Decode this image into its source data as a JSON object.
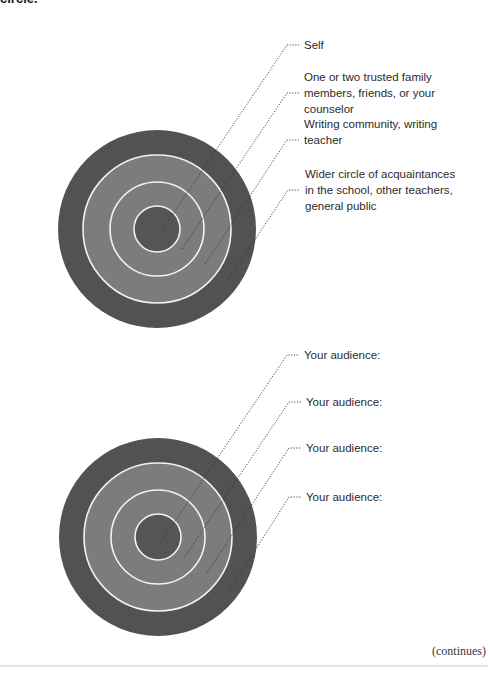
{
  "heading": "circle.",
  "colors": {
    "outer_ring": "#525252",
    "middle_band": "#7c7c7c",
    "inner_core": "#555555",
    "ring_line": "#f2f2f2",
    "leader_line": "#333333"
  },
  "diagrams": [
    {
      "id": "example",
      "center": [
        157,
        229
      ],
      "radii": {
        "outer": 99,
        "ring3": 74,
        "ring2": 47,
        "inner": 23
      },
      "labels": [
        {
          "text": "Self",
          "line_y": 45,
          "elbow_x": 287,
          "end": [
            160,
            233
          ],
          "text_top": 37
        },
        {
          "text": "One or two trusted family\nmembers, friends, or your\ncounselor",
          "line_y": 93,
          "elbow_x": 287,
          "end": [
            182,
            249
          ],
          "text_top": 69
        },
        {
          "text": "Writing community, writing\nteacher",
          "line_y": 140,
          "elbow_x": 287,
          "end": [
            205,
            264
          ],
          "text_top": 116
        },
        {
          "text": "Wider circle of acquaintances\nin the school, other teachers,\ngeneral public",
          "line_y": 190,
          "elbow_x": 288,
          "end": [
            228,
            280
          ],
          "text_top": 166
        }
      ]
    },
    {
      "id": "worksheet",
      "center": [
        158,
        537
      ],
      "radii": {
        "outer": 99,
        "ring3": 74,
        "ring2": 47,
        "inner": 23
      },
      "labels": [
        {
          "text": "Your audience:",
          "line_y": 355,
          "elbow_x": 287,
          "end": [
            161,
            542
          ],
          "text_top": 347
        },
        {
          "text": "Your audience:",
          "line_y": 402,
          "elbow_x": 289,
          "end": [
            184,
            558
          ],
          "text_top": 394
        },
        {
          "text": "Your audience:",
          "line_y": 448,
          "elbow_x": 289,
          "end": [
            207,
            573
          ],
          "text_top": 440
        },
        {
          "text": "Your audience:",
          "line_y": 497,
          "elbow_x": 289,
          "end": [
            230,
            590
          ],
          "text_top": 489
        }
      ]
    }
  ],
  "footer": {
    "continues": "(continues)"
  }
}
